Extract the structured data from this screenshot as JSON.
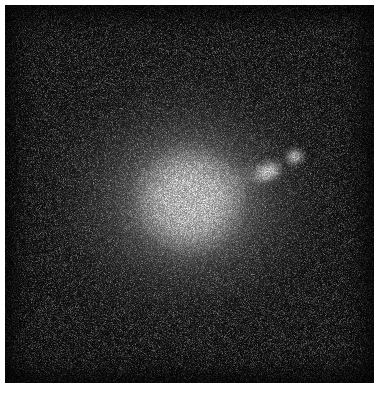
{
  "figure": {
    "kind": "astronomical-image",
    "modality": "grayscale intensity map",
    "canvas_width": 385,
    "canvas_height": 395,
    "background_color": "#ffffff",
    "plate_color": "#050505",
    "peak_color": "#ffffff"
  },
  "plate": {
    "left": 5,
    "top": 5,
    "width": 369,
    "height": 378
  },
  "sources": [
    {
      "id": "nucleus",
      "label": "galaxy nucleus",
      "x": 190,
      "y": 200,
      "radius": 16,
      "peak_intensity": 255,
      "shape": "saturated core"
    },
    {
      "id": "halo-main",
      "label": "galaxy halo",
      "x": 190,
      "y": 200,
      "semi_major": 150,
      "semi_minor": 132,
      "position_angle_deg": -28,
      "peak_intensity": 230,
      "shape": "elliptical diffuse envelope"
    },
    {
      "id": "halo-outer",
      "label": "outer envelope",
      "x": 185,
      "y": 198,
      "semi_major": 215,
      "semi_minor": 190,
      "position_angle_deg": -28,
      "peak_intensity": 95,
      "shape": "faint extended envelope"
    },
    {
      "id": "knot-a",
      "label": "inner knot",
      "x": 267,
      "y": 172,
      "semi_major": 23,
      "semi_minor": 15,
      "position_angle_deg": -22,
      "peak_intensity": 255,
      "shape": "elongated compact knot"
    },
    {
      "id": "knot-b",
      "label": "outer knot",
      "x": 295,
      "y": 157,
      "semi_major": 14,
      "semi_minor": 12,
      "position_angle_deg": -18,
      "peak_intensity": 250,
      "shape": "round compact knot"
    },
    {
      "id": "bridge",
      "label": "jet bridge",
      "x": 232,
      "y": 184,
      "length": 70,
      "position_angle_deg": -24,
      "peak_intensity": 120,
      "shape": "faint linear emission"
    },
    {
      "id": "point-source",
      "label": "faint point source",
      "x": 122,
      "y": 371,
      "radius": 3,
      "peak_intensity": 70,
      "shape": "unresolved point"
    }
  ],
  "scale": {
    "units": "pixels",
    "noise": "photon shot noise, visible speckle",
    "stretch": "logarithmic"
  }
}
